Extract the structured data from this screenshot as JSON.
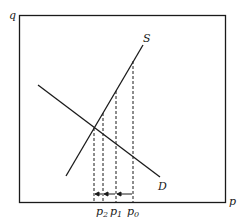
{
  "diagram": {
    "type": "supply-demand",
    "axes": {
      "vertical_label": "q",
      "horizontal_label": "p"
    },
    "curves": [
      {
        "name": "S",
        "label": "S",
        "kind": "supply"
      },
      {
        "name": "D",
        "label": "D",
        "kind": "demand"
      }
    ],
    "price_markers": [
      {
        "base": "p",
        "sub": "2"
      },
      {
        "base": "p",
        "sub": "1"
      },
      {
        "base": "p",
        "sub": "0"
      }
    ],
    "colors": {
      "line": "#1a1a1a",
      "background": "#ffffff"
    }
  }
}
